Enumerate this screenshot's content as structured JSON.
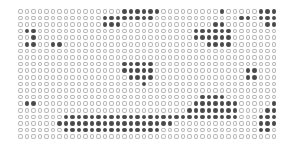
{
  "grid": {
    "columns": 40,
    "rows": 20,
    "cell_states_legend": {
      "0": "empty-circle",
      "1": "filled-circle"
    },
    "row_data": [
      "0000000000000000111111000000000100000111110001111000000000000000",
      "0000000000000111111110000000000000110111110000111111100000000000",
      "0000000000000111000000000000001100000011110000011111100000000000",
      "0110000000000000000000000001111110000000011100000100010000000000",
      "0010000000000000000000000001111110000000000110000000000000000001",
      "0110011000000000000000000000011110000000001110000000000000000001",
      "0000000000000000000000000000000000000000000000000000000000000000",
      "0000000000000000000000000000000000000000000000000000000000000000",
      "0000000000000000111110000000000000000000000011110000000000000000",
      "0000000000000000111110000000000000011000000011110000000000000000",
      "0000000000000000011110000000000000011000000011110000000000000000",
      "0000000000000000000100000000000000000000000000000000000000000000",
      "0000000000000000000000000000000000000000000000000000000000000000",
      "0000000000000000000000000000111100000000000000000000000000111100",
      "0110000000000000000000000001111111000001111100000000000011111100",
      "0000000000000000000000000011111111000011111100000000011111111100",
      "0000000111111111111111111111111111000111111100000000111111111110",
      "0000001111111111111111110000000000000111111100001110111111111110",
      "0000000111111111111111000000000000000110001100000000001111111110",
      "0000000000000000000000000000000000000000000000000000000000000000"
    ]
  }
}
